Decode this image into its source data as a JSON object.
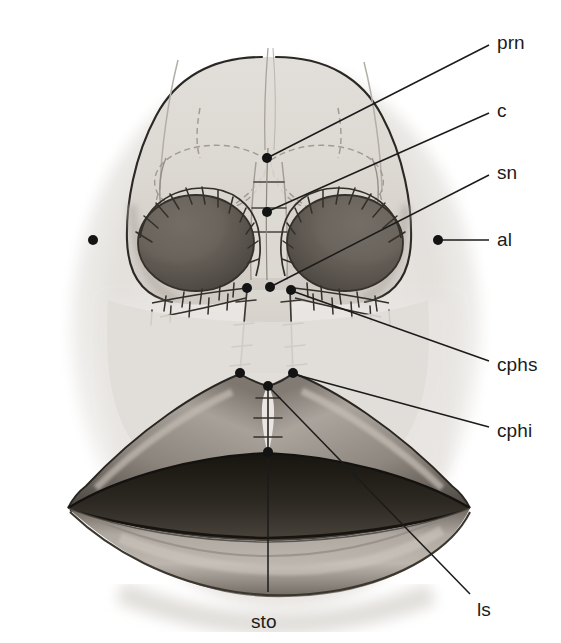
{
  "figure": {
    "view": "basal (submental-vertex) view",
    "background_color": "#ffffff",
    "ink_color": "#1b1b1b",
    "skin_light": "#e9e7e4",
    "skin_mid": "#cfcbc6",
    "skin_shadow": "#9b958e",
    "nostril_dark": "#4a4641",
    "lip_mid": "#8f8880",
    "lip_dark": "#3a3631",
    "mouth_line": "#211e1b"
  },
  "landmarks": [
    {
      "id": "prn",
      "label": "prn",
      "name": "pronasale",
      "point": {
        "x": 267,
        "y": 158
      },
      "label_pos": {
        "x": 497,
        "y": 33
      },
      "leader": [
        {
          "x": 271,
          "y": 156
        },
        {
          "x": 489,
          "y": 45
        }
      ],
      "dot": true
    },
    {
      "id": "c",
      "label": "c",
      "name": "columella",
      "point": {
        "x": 267,
        "y": 212
      },
      "label_pos": {
        "x": 497,
        "y": 101
      },
      "leader": [
        {
          "x": 271,
          "y": 210
        },
        {
          "x": 489,
          "y": 113
        }
      ],
      "dot": true
    },
    {
      "id": "sn",
      "label": "sn",
      "name": "subnasale",
      "point": {
        "x": 270,
        "y": 287
      },
      "label_pos": {
        "x": 497,
        "y": 163
      },
      "leader": [
        {
          "x": 274,
          "y": 285
        },
        {
          "x": 489,
          "y": 175
        }
      ],
      "dot": true
    },
    {
      "id": "al-right",
      "label": "al",
      "name": "alare (right)",
      "point": {
        "x": 438,
        "y": 240
      },
      "label_pos": {
        "x": 497,
        "y": 230
      },
      "leader": [
        {
          "x": 442,
          "y": 240
        },
        {
          "x": 489,
          "y": 240
        }
      ],
      "dot": true
    },
    {
      "id": "al-left",
      "label": "",
      "name": "alare (left, unlabeled)",
      "point": {
        "x": 93,
        "y": 240
      },
      "label_pos": null,
      "leader": null,
      "dot": true
    },
    {
      "id": "cphs-left",
      "label": "",
      "name": "crista philtri superior (left)",
      "point": {
        "x": 247,
        "y": 288
      },
      "label_pos": null,
      "leader": null,
      "dot": true
    },
    {
      "id": "cphs",
      "label": "cphs",
      "name": "crista philtri superior (right)",
      "point": {
        "x": 291,
        "y": 290
      },
      "label_pos": {
        "x": 497,
        "y": 355
      },
      "leader": [
        {
          "x": 295,
          "y": 292
        },
        {
          "x": 489,
          "y": 361
        }
      ],
      "dot": true
    },
    {
      "id": "cphi-left",
      "label": "",
      "name": "crista philtri inferior (left)",
      "point": {
        "x": 240,
        "y": 373
      },
      "label_pos": null,
      "leader": null,
      "dot": true
    },
    {
      "id": "cphi",
      "label": "cphi",
      "name": "crista philtri inferior (right)",
      "point": {
        "x": 293,
        "y": 373
      },
      "label_pos": {
        "x": 497,
        "y": 421
      },
      "leader": [
        {
          "x": 297,
          "y": 375
        },
        {
          "x": 489,
          "y": 427
        }
      ],
      "dot": true
    },
    {
      "id": "ls",
      "label": "ls",
      "name": "labiale superius",
      "point": {
        "x": 268,
        "y": 386
      },
      "label_pos": {
        "x": 477,
        "y": 600
      },
      "leader": [
        {
          "x": 271,
          "y": 389
        },
        {
          "x": 470,
          "y": 594
        }
      ],
      "dot": true
    },
    {
      "id": "sto",
      "label": "sto",
      "name": "stomion",
      "point": {
        "x": 268,
        "y": 452
      },
      "label_pos": {
        "x": 251,
        "y": 612
      },
      "leader": [
        {
          "x": 268,
          "y": 456
        },
        {
          "x": 268,
          "y": 592
        }
      ],
      "dot": true
    }
  ]
}
